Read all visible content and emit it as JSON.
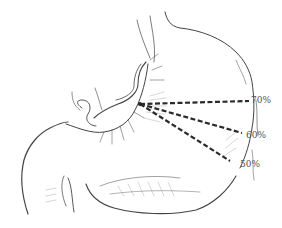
{
  "figure": {
    "line_color": "#2a2a2a",
    "sketch_color": "#444444",
    "label_color": "#555555",
    "background": "#ffffff"
  },
  "resection_lines": [
    {
      "label": "70%",
      "from": [
        140,
        104
      ],
      "to": [
        249,
        101
      ],
      "label_pos": [
        251,
        96
      ]
    },
    {
      "label": "60%",
      "from": [
        140,
        104
      ],
      "to": [
        242,
        133
      ],
      "label_pos": [
        246,
        131
      ]
    },
    {
      "label": "50%",
      "from": [
        140,
        104
      ],
      "to": [
        230,
        161
      ],
      "label_pos": [
        240,
        160
      ]
    }
  ]
}
